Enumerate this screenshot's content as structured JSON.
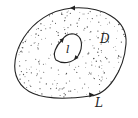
{
  "diagram": {
    "region_label": "D",
    "outer_curve_label": "L",
    "inner_curve_label": "l",
    "stroke_color": "#222222",
    "dot_color": "#555555",
    "orientation": {
      "outer_curve": "counterclockwise",
      "inner_curve": "clockwise"
    }
  }
}
